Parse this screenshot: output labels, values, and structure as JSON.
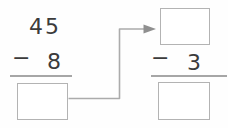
{
  "worksheet": {
    "left_problem": {
      "minuend_tens": "4",
      "minuend_ones": "5",
      "operator": "−",
      "subtrahend": "8",
      "answer_box_value": ""
    },
    "right_problem": {
      "minuend_box_value": "",
      "operator": "−",
      "subtrahend": "3",
      "answer_box_value": ""
    },
    "arrow": {
      "description": "connector from left answer box to right minuend box",
      "direction": "right-up-right"
    },
    "colors": {
      "digit_color": "#3b3b3b",
      "rule_line_color": "#a6a6a6",
      "box_border_color": "#b3b3b3",
      "arrow_line_color": "#ababab",
      "arrowhead_color": "#8f8f8f",
      "background": "#fefefe"
    }
  }
}
